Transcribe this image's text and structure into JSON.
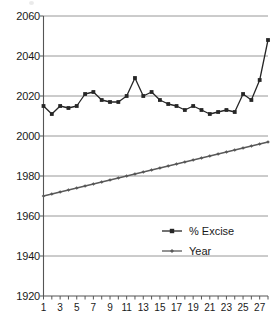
{
  "chart_data": {
    "type": "line",
    "title": "",
    "xlabel": "",
    "ylabel": "",
    "ylim": [
      1920,
      2060
    ],
    "ytick_step": 20,
    "yticks": [
      1920,
      1940,
      1960,
      1980,
      2000,
      2020,
      2040,
      2060
    ],
    "ytick_labels": [
      "1920",
      "1940",
      "1960",
      "1980",
      "2000",
      "2020",
      "2040",
      "2060"
    ],
    "xlim": [
      1,
      28
    ],
    "x": [
      1,
      2,
      3,
      4,
      5,
      6,
      7,
      8,
      9,
      10,
      11,
      12,
      13,
      14,
      15,
      16,
      17,
      18,
      19,
      20,
      21,
      22,
      23,
      24,
      25,
      26,
      27,
      28
    ],
    "xticks": [
      1,
      2,
      3,
      4,
      5,
      6,
      7,
      8,
      9,
      10,
      11,
      12,
      13,
      14,
      15,
      16,
      17,
      18,
      19,
      20,
      21,
      22,
      23,
      24,
      25,
      26,
      27,
      28
    ],
    "xtick_labels_shown": [
      "1",
      "3",
      "5",
      "7",
      "9",
      "11",
      "13",
      "15",
      "17",
      "19",
      "21",
      "23",
      "25",
      "27"
    ],
    "xtick_labels_shown_at": [
      1,
      3,
      5,
      7,
      9,
      11,
      13,
      15,
      17,
      19,
      21,
      23,
      25,
      27
    ],
    "grid": true,
    "grid_axis": "y",
    "legend_position": "lower-right",
    "series": [
      {
        "name": "% Excise",
        "marker": "square",
        "color": "#262626",
        "values": [
          2015,
          2011,
          2015,
          2014,
          2015,
          2021,
          2022,
          2018,
          2017,
          2017,
          2020,
          2029,
          2020,
          2022,
          2018,
          2016,
          2015,
          2013,
          2015,
          2013,
          2011,
          2012,
          2013,
          2012,
          2021,
          2018,
          2028,
          2048
        ]
      },
      {
        "name": "Year",
        "marker": "diamond",
        "color": "#595959",
        "values": [
          1970,
          1971,
          1972,
          1973,
          1974,
          1975,
          1976,
          1977,
          1978,
          1979,
          1980,
          1981,
          1982,
          1983,
          1984,
          1985,
          1986,
          1987,
          1988,
          1989,
          1990,
          1991,
          1992,
          1993,
          1994,
          1995,
          1996,
          1997
        ]
      }
    ]
  },
  "legend": {
    "items": [
      {
        "label": "% Excise",
        "marker": "square"
      },
      {
        "label": "Year",
        "marker": "diamond"
      }
    ]
  },
  "colors": {
    "axis": "#555555",
    "grid": "#8c8c8c",
    "excise": "#262626",
    "year": "#595959",
    "text": "#1a1a1a"
  }
}
